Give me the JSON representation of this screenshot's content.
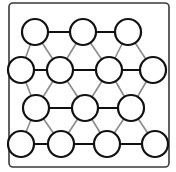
{
  "diagram": {
    "type": "triangular-lattice",
    "style": "hand-drawn",
    "frame": {
      "x": 9,
      "y": 3,
      "width": 160,
      "height": 164,
      "radius": 4,
      "color": "#3a3a3a"
    },
    "colors": {
      "node_stroke": "#111111",
      "horizontal_edge": "#111111",
      "diagonal_edge": "#8a8a8a",
      "background": "#ffffff"
    },
    "node_radius": 13,
    "rows": [
      {
        "row": 1,
        "y": 32,
        "x": [
          35,
          83,
          128
        ]
      },
      {
        "row": 2,
        "y": 70,
        "x": [
          21,
          60,
          109,
          153
        ]
      },
      {
        "row": 3,
        "y": 108,
        "x": [
          36,
          85,
          131
        ]
      },
      {
        "row": 4,
        "y": 144,
        "x": [
          21,
          61,
          107,
          155
        ]
      }
    ],
    "node_count": 14
  }
}
